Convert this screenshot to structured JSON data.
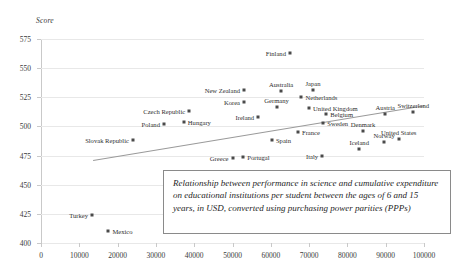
{
  "chart_data": {
    "type": "scatter",
    "title": "",
    "xlabel": "",
    "ylabel": "Score",
    "xlim": [
      0,
      100000
    ],
    "ylim": [
      400,
      575
    ],
    "grid": true,
    "legend": "none",
    "xticks": [
      "0",
      "10000",
      "20000",
      "30000",
      "40000",
      "50000",
      "60000",
      "70000",
      "80000",
      "90000",
      "100000"
    ],
    "yticks": [
      "400",
      "425",
      "450",
      "475",
      "500",
      "525",
      "550",
      "575"
    ],
    "annotation": "Relationship between performance in science and cumulative expenditure on educational institutions per student between the ages of 6 and 15 years, in USD, converted using purchasing power parities (PPPs)",
    "trendline": {
      "x0": 13500,
      "y0": 471,
      "x1": 100000,
      "y1": 518
    },
    "points": [
      {
        "label": "Finland",
        "x": 65000,
        "y": 563,
        "pos": "r"
      },
      {
        "label": "New Zealand",
        "x": 53000,
        "y": 531,
        "pos": "r"
      },
      {
        "label": "Australia",
        "x": 62700,
        "y": 530,
        "pos": "t"
      },
      {
        "label": "Japan",
        "x": 71000,
        "y": 531,
        "pos": "t"
      },
      {
        "label": "Korea",
        "x": 53000,
        "y": 521,
        "pos": "r"
      },
      {
        "label": "Netherlands",
        "x": 68000,
        "y": 525,
        "pos": "l"
      },
      {
        "label": "Germany",
        "x": 61500,
        "y": 517,
        "pos": "t"
      },
      {
        "label": "United Kingdom",
        "x": 70000,
        "y": 516,
        "pos": "l"
      },
      {
        "label": "Czech Republic",
        "x": 38700,
        "y": 513,
        "pos": "r"
      },
      {
        "label": "Belgium",
        "x": 74500,
        "y": 511,
        "pos": "l"
      },
      {
        "label": "Switzerland",
        "x": 97200,
        "y": 512,
        "pos": "t"
      },
      {
        "label": "Austria",
        "x": 89900,
        "y": 511,
        "pos": "t"
      },
      {
        "label": "Hungary",
        "x": 37300,
        "y": 504,
        "pos": "l"
      },
      {
        "label": "Sweden",
        "x": 73700,
        "y": 503,
        "pos": "l"
      },
      {
        "label": "Ireland",
        "x": 56700,
        "y": 508,
        "pos": "r"
      },
      {
        "label": "Poland",
        "x": 32100,
        "y": 502,
        "pos": "r"
      },
      {
        "label": "Denmark",
        "x": 84100,
        "y": 496,
        "pos": "t"
      },
      {
        "label": "United States",
        "x": 93400,
        "y": 489,
        "pos": "t"
      },
      {
        "label": "France",
        "x": 67100,
        "y": 495,
        "pos": "l"
      },
      {
        "label": "Slovak Republic",
        "x": 24000,
        "y": 488,
        "pos": "r"
      },
      {
        "label": "Spain",
        "x": 60300,
        "y": 488,
        "pos": "l"
      },
      {
        "label": "Iceland",
        "x": 83100,
        "y": 481,
        "pos": "t"
      },
      {
        "label": "Norway",
        "x": 89600,
        "y": 487,
        "pos": "t"
      },
      {
        "label": "Italy",
        "x": 73400,
        "y": 475,
        "pos": "r"
      },
      {
        "label": "Portugal",
        "x": 52800,
        "y": 474,
        "pos": "l"
      },
      {
        "label": "Greece",
        "x": 50000,
        "y": 473,
        "pos": "r"
      },
      {
        "label": "Turkey",
        "x": 13300,
        "y": 424,
        "pos": "r"
      },
      {
        "label": "Mexico",
        "x": 17600,
        "y": 410,
        "pos": "l"
      }
    ]
  }
}
